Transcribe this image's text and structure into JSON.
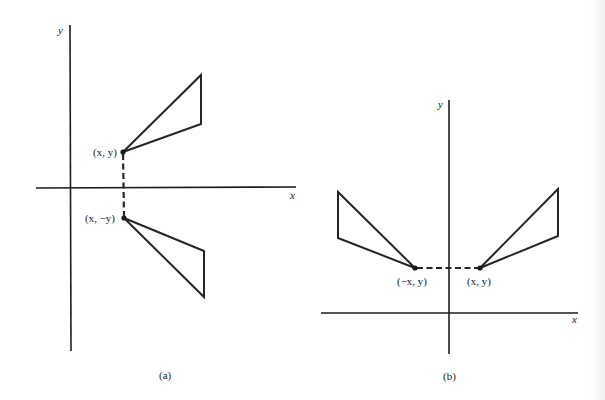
{
  "figure": {
    "panel_a": {
      "caption": "(a)",
      "x_axis_label": "x",
      "y_axis_label": "y",
      "point_original_label": "(x, y)",
      "point_reflected_label": "(x, −y)",
      "description": "Reflection across the x-axis"
    },
    "panel_b": {
      "caption": "(b)",
      "x_axis_label": "x",
      "y_axis_label": "y",
      "point_original_label": "(x, y)",
      "point_reflected_label": "(−x, y)",
      "description": "Reflection across the y-axis"
    }
  },
  "colors": {
    "ink": "#262626",
    "background": "#ffffff"
  }
}
